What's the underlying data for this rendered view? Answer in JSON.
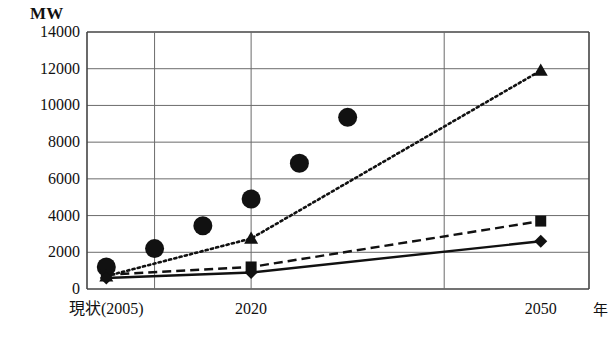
{
  "chart_data": {
    "type": "scatter",
    "title": "",
    "subtitle": "",
    "unit_label": "MW",
    "xlabel": "年",
    "ylabel": "MW",
    "ylim": [
      0,
      14000
    ],
    "xlim": [
      2003,
      2055
    ],
    "grid": true,
    "legend_position": "none",
    "ytick_labels": [
      "14000",
      "12000",
      "10000",
      "8000",
      "6000",
      "4000",
      "2000",
      "0"
    ],
    "ytick_values": [
      14000,
      12000,
      10000,
      8000,
      6000,
      4000,
      2000,
      0
    ],
    "xtick_labels": [
      "現状(2005)",
      "2020",
      "2050"
    ],
    "xtick_values": [
      2005,
      2020,
      2050
    ],
    "vertical_gridline_values": [
      2010,
      2020,
      2040
    ],
    "series": [
      {
        "name": "circles-scatter",
        "marker": "circle",
        "line": "none",
        "color": "#111111",
        "points": [
          {
            "x": 2005,
            "y": 1200
          },
          {
            "x": 2010,
            "y": 2200
          },
          {
            "x": 2015,
            "y": 3450
          },
          {
            "x": 2020,
            "y": 4900
          },
          {
            "x": 2025,
            "y": 6850
          },
          {
            "x": 2030,
            "y": 9350
          }
        ]
      },
      {
        "name": "triangles-dotted",
        "marker": "triangle",
        "line": "dotted",
        "color": "#111111",
        "points": [
          {
            "x": 2005,
            "y": 700
          },
          {
            "x": 2020,
            "y": 2750
          },
          {
            "x": 2050,
            "y": 11900
          }
        ]
      },
      {
        "name": "squares-dashed",
        "marker": "square",
        "line": "dashed",
        "color": "#111111",
        "points": [
          {
            "x": 2005,
            "y": 780
          },
          {
            "x": 2020,
            "y": 1200
          },
          {
            "x": 2050,
            "y": 3700
          }
        ]
      },
      {
        "name": "diamonds-solid",
        "marker": "diamond",
        "line": "solid",
        "color": "#111111",
        "points": [
          {
            "x": 2005,
            "y": 600
          },
          {
            "x": 2020,
            "y": 900
          },
          {
            "x": 2050,
            "y": 2600
          }
        ]
      }
    ]
  },
  "colors": {
    "ink": "#111111",
    "grid": "#6b6b6b",
    "axis": "#444444",
    "background": "#ffffff"
  }
}
